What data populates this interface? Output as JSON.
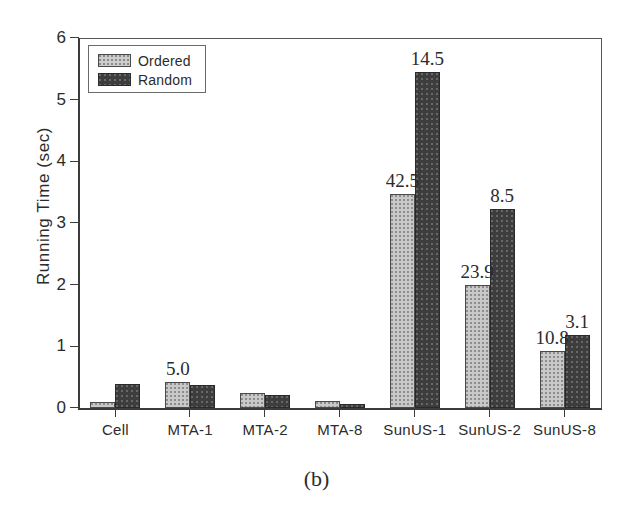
{
  "caption": "(b)",
  "legend": {
    "position": "top-left",
    "entries": [
      {
        "label": "Ordered",
        "swatch": "ordered-swatch",
        "color": "#c9c9c9"
      },
      {
        "label": "Random",
        "swatch": "random-swatch",
        "color": "#3d3d3d"
      }
    ]
  },
  "chart_data": {
    "type": "bar",
    "title": "",
    "subtitle": "",
    "xlabel": "",
    "ylabel": "Running Time (sec)",
    "ylim": [
      0,
      6
    ],
    "yticks": [
      0,
      1,
      2,
      3,
      4,
      5,
      6
    ],
    "ytick_labels": [
      "0",
      "1",
      "2",
      "3",
      "4",
      "5",
      "6"
    ],
    "grid": false,
    "legend_position": "upper left",
    "categories": [
      "Cell",
      "MTA-1",
      "MTA-2",
      "MTA-8",
      "SunUS-1",
      "SunUS-2",
      "SunUS-8"
    ],
    "series": [
      {
        "name": "Ordered",
        "color": "#c9c9c9",
        "values": [
          0.09,
          0.42,
          0.25,
          0.11,
          3.47,
          2.0,
          0.92
        ]
      },
      {
        "name": "Random",
        "color": "#3d3d3d",
        "values": [
          0.39,
          0.38,
          0.21,
          0.07,
          5.45,
          3.22,
          1.18
        ]
      }
    ],
    "annotations": [
      {
        "text": "5.0",
        "category": "MTA-1",
        "series": "Ordered",
        "value": 0.42
      },
      {
        "text": "42.5",
        "category": "SunUS-1",
        "series": "Ordered",
        "value": 3.47
      },
      {
        "text": "14.5",
        "category": "SunUS-1",
        "series": "Random",
        "value": 5.45
      },
      {
        "text": "23.9",
        "category": "SunUS-2",
        "series": "Ordered",
        "value": 2.0
      },
      {
        "text": "8.5",
        "category": "SunUS-2",
        "series": "Random",
        "value": 3.22
      },
      {
        "text": "10.8",
        "category": "SunUS-8",
        "series": "Ordered",
        "value": 0.92
      },
      {
        "text": "3.1",
        "category": "SunUS-8",
        "series": "Random",
        "value": 1.18
      }
    ]
  }
}
